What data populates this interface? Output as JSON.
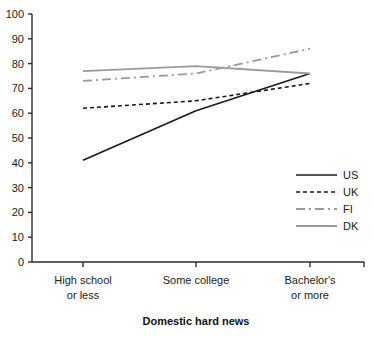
{
  "chart_data": {
    "type": "line",
    "title": "",
    "xlabel": "Domestic hard news",
    "ylabel": "",
    "ylim": [
      0,
      100
    ],
    "grid": false,
    "legend_position": "bottom-right",
    "categories": [
      "High school or less",
      "Some college",
      "Bachelor's or more"
    ],
    "category_lines": [
      [
        "High school",
        "or less"
      ],
      [
        "Some college",
        ""
      ],
      [
        "Bachelor's",
        "or more"
      ]
    ],
    "yticks": [
      0,
      10,
      20,
      30,
      40,
      50,
      60,
      70,
      80,
      90,
      100
    ],
    "series": [
      {
        "name": "US",
        "values": [
          41,
          61,
          76
        ],
        "color": "#1a1a1a",
        "dash": "none",
        "width": 1.6
      },
      {
        "name": "UK",
        "values": [
          62,
          65,
          72
        ],
        "color": "#1a1a1a",
        "dash": "dotted",
        "width": 1.6
      },
      {
        "name": "FI",
        "values": [
          73,
          76,
          86
        ],
        "color": "#9a9a9a",
        "dash": "dashed",
        "width": 1.8
      },
      {
        "name": "DK",
        "values": [
          77,
          79,
          76
        ],
        "color": "#9a9a9a",
        "dash": "none",
        "width": 1.8
      }
    ]
  },
  "legend": {
    "entries": [
      {
        "label": "US"
      },
      {
        "label": "UK"
      },
      {
        "label": "FI"
      },
      {
        "label": "DK"
      }
    ]
  },
  "axis": {
    "x_title": "Domestic hard news"
  },
  "colors": {
    "axis": "#2b2b2b",
    "dark_series": "#1a1a1a",
    "light_series": "#9a9a9a",
    "background": "#ffffff"
  }
}
